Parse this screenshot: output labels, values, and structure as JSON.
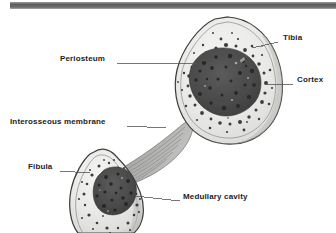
{
  "figure": {
    "background_color": "#ffffff",
    "width": 336,
    "height": 233
  },
  "top_bar": {
    "name": "header-rule",
    "color_dark": "#5d5d5d",
    "color_light": "#8e8e8e",
    "x": 10,
    "y": 2,
    "width": 326,
    "height": 7
  },
  "palette": {
    "cortex_fill": "#e8e8e6",
    "cortex_edge": "#8a8a88",
    "outline": "#4a4a48",
    "marrow_dark": "#4a4a4a",
    "marrow_mid": "#6e6e6e",
    "spongy_spot": "#3a3a3a",
    "membrane_fill": "#b8b8b6",
    "membrane_fiber": "#7a7a78",
    "leader_line": "#55555a",
    "text": "#1d1d1d"
  },
  "labels": [
    {
      "id": "tibia",
      "text": "Tibia",
      "side": "right",
      "text_x": 283,
      "text_y": 38,
      "leader": {
        "x1": 278,
        "y1": 42,
        "x2": 252,
        "y2": 48
      }
    },
    {
      "id": "cortex",
      "text": "Cortex",
      "side": "right",
      "text_x": 297,
      "text_y": 80,
      "leader": {
        "x1": 293,
        "y1": 84,
        "x2": 267,
        "y2": 84
      }
    },
    {
      "id": "periosteum",
      "text": "Periosteum",
      "side": "left",
      "text_x": 60,
      "text_y": 59,
      "leader": {
        "x1": 117,
        "y1": 63,
        "x2": 197,
        "y2": 63
      }
    },
    {
      "id": "interosseous-membrane",
      "text": "Interosseous membrane",
      "side": "left",
      "text_x": 10,
      "text_y": 122,
      "leader": {
        "x1": 127,
        "y1": 126,
        "x2": 166,
        "y2": 128
      }
    },
    {
      "id": "fibula",
      "text": "Fibula",
      "side": "left",
      "text_x": 28,
      "text_y": 167,
      "leader": {
        "x1": 60,
        "y1": 171,
        "x2": 90,
        "y2": 173
      }
    },
    {
      "id": "medullary-cavity",
      "text": "Medullary cavity",
      "side": "right",
      "text_x": 183,
      "text_y": 197,
      "leader": {
        "x1": 180,
        "y1": 201,
        "x2": 135,
        "y2": 196
      }
    }
  ],
  "structures": {
    "tibia": {
      "name": "tibia-cross-section",
      "label": "Tibia"
    },
    "fibula": {
      "name": "fibula-cross-section",
      "label": "Fibula"
    },
    "membrane": {
      "name": "interosseous-membrane-band",
      "label": "Interosseous membrane"
    },
    "tibia_marrow": {
      "name": "tibia-medullary-cavity",
      "label": "Medullary cavity"
    },
    "fibula_marrow": {
      "name": "fibula-medullary-cavity",
      "label": "Medullary cavity"
    }
  }
}
